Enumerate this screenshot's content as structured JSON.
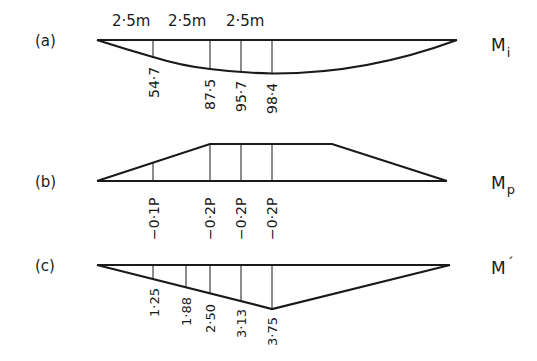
{
  "figure": {
    "panels": [
      {
        "id": "a",
        "tag": "(a)",
        "symbol": "M",
        "subscript": "i",
        "spans": [
          "2·5m",
          "2·5m",
          "2·5m"
        ],
        "ordinates": [
          "54·7",
          "87·5",
          "95·7",
          "98·4"
        ]
      },
      {
        "id": "b",
        "tag": "(b)",
        "symbol": "M",
        "subscript": "p",
        "ordinates": [
          "−0·1P",
          "−0·2P",
          "−0·2P",
          "−0·2P"
        ]
      },
      {
        "id": "c",
        "tag": "(c)",
        "symbol": "M",
        "prime": "´",
        "ordinates": [
          "1·25",
          "1·88",
          "2·50",
          "3·13",
          "3·75"
        ]
      }
    ]
  },
  "colors": {
    "ink": "#1a1a1a",
    "background": "#ffffff"
  }
}
